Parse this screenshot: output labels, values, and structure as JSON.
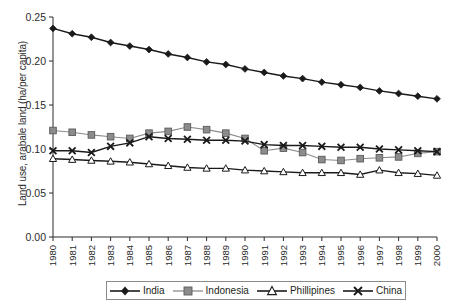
{
  "chart_data": {
    "type": "line",
    "title": "",
    "xlabel": "",
    "ylabel": "Land use, arabale land (ha/per capita)",
    "x": [
      1980,
      1981,
      1982,
      1983,
      1984,
      1985,
      1986,
      1987,
      1988,
      1989,
      1990,
      1991,
      1992,
      1993,
      1994,
      1995,
      1996,
      1997,
      1998,
      1999,
      2000
    ],
    "xtick_labels": [
      "1980",
      "1981",
      "1982",
      "1983",
      "1984",
      "1985",
      "1986",
      "1987",
      "1988",
      "1989",
      "1990",
      "1991",
      "1992",
      "1993",
      "1994",
      "1995",
      "1996",
      "1997",
      "1998",
      "1999",
      "2000"
    ],
    "ytick_labels": [
      "0.00",
      "0.05",
      "0.10",
      "0.15",
      "0.20",
      "0.25"
    ],
    "yticks": [
      0.0,
      0.05,
      0.1,
      0.15,
      0.2,
      0.25
    ],
    "ylim": [
      0.0,
      0.25
    ],
    "xlim": [
      1980,
      2000
    ],
    "grid": false,
    "legend_position": "bottom",
    "series": [
      {
        "name": "India",
        "marker": "filled-diamond",
        "color": "#1a1a1a",
        "values": [
          0.237,
          0.231,
          0.227,
          0.221,
          0.217,
          0.213,
          0.208,
          0.204,
          0.199,
          0.196,
          0.191,
          0.187,
          0.183,
          0.18,
          0.176,
          0.173,
          0.17,
          0.166,
          0.163,
          0.16,
          0.157
        ]
      },
      {
        "name": "Indonesia",
        "marker": "filled-square",
        "color": "#8c8c8c",
        "values": [
          0.121,
          0.119,
          0.116,
          0.114,
          0.112,
          0.118,
          0.12,
          0.125,
          0.122,
          0.118,
          0.112,
          0.098,
          0.101,
          0.096,
          0.088,
          0.087,
          0.089,
          0.09,
          0.091,
          0.095,
          0.097
        ]
      },
      {
        "name": "Phillipines",
        "marker": "open-triangle",
        "color": "#1a1a1a",
        "values": [
          0.089,
          0.088,
          0.087,
          0.086,
          0.085,
          0.083,
          0.081,
          0.079,
          0.078,
          0.078,
          0.076,
          0.075,
          0.074,
          0.073,
          0.073,
          0.073,
          0.071,
          0.076,
          0.073,
          0.072,
          0.07
        ]
      },
      {
        "name": "China",
        "marker": "cross-x",
        "color": "#1a1a1a",
        "values": [
          0.098,
          0.098,
          0.096,
          0.103,
          0.107,
          0.114,
          0.112,
          0.111,
          0.11,
          0.11,
          0.109,
          0.105,
          0.104,
          0.104,
          0.103,
          0.102,
          0.102,
          0.1,
          0.099,
          0.098,
          0.097
        ]
      }
    ]
  },
  "legend": {
    "items": [
      {
        "label": "India"
      },
      {
        "label": "Indonesia"
      },
      {
        "label": "Phillipines"
      },
      {
        "label": "China"
      }
    ]
  }
}
